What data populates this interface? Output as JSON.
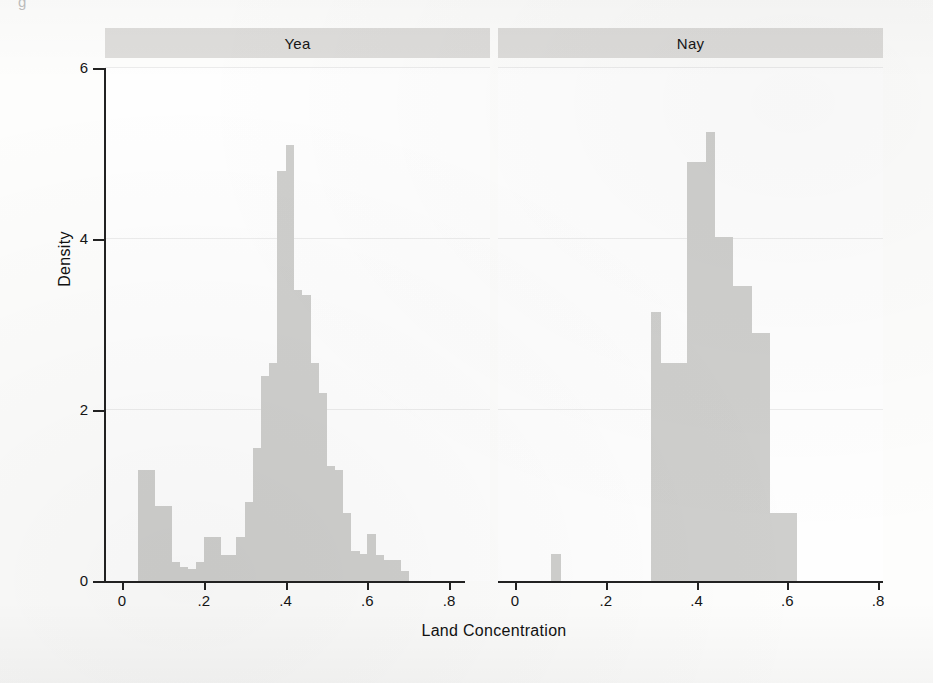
{
  "figure": {
    "stray_mark": "g",
    "ylabel": "Density",
    "xlabel": "Land Concentration",
    "bar_color": "#cfcfcd",
    "strip_color": "#dedddb",
    "axis_color": "#222222",
    "grid_color": "#ececec"
  },
  "axes": {
    "y_ticks": [
      0,
      2,
      4,
      6
    ],
    "y_tick_labels": [
      "0",
      "2",
      "4",
      "6"
    ],
    "x_ticks": [
      0,
      0.2,
      0.4,
      0.6,
      0.8
    ],
    "x_tick_labels": [
      "0",
      ".2",
      ".4",
      ".6",
      ".8"
    ]
  },
  "chart_data": {
    "type": "bar",
    "title": "",
    "subtitle": "",
    "xlabel": "Land Concentration",
    "ylabel": "Density",
    "xlim": [
      0,
      0.8
    ],
    "ylim": [
      0,
      6
    ],
    "grid": true,
    "grid_axis": "y",
    "legend": "none",
    "panel_layout": "side-by-side facets",
    "bin_width": 0.02,
    "panels": [
      {
        "label": "Yea",
        "bins": [
          {
            "x": 0.04,
            "density": 1.3
          },
          {
            "x": 0.06,
            "density": 1.3
          },
          {
            "x": 0.08,
            "density": 0.88
          },
          {
            "x": 0.1,
            "density": 0.88
          },
          {
            "x": 0.12,
            "density": 0.22
          },
          {
            "x": 0.14,
            "density": 0.16
          },
          {
            "x": 0.16,
            "density": 0.14
          },
          {
            "x": 0.18,
            "density": 0.22
          },
          {
            "x": 0.2,
            "density": 0.52
          },
          {
            "x": 0.22,
            "density": 0.52
          },
          {
            "x": 0.24,
            "density": 0.3
          },
          {
            "x": 0.26,
            "density": 0.3
          },
          {
            "x": 0.28,
            "density": 0.52
          },
          {
            "x": 0.3,
            "density": 0.92
          },
          {
            "x": 0.32,
            "density": 1.55
          },
          {
            "x": 0.34,
            "density": 2.4
          },
          {
            "x": 0.36,
            "density": 2.55
          },
          {
            "x": 0.38,
            "density": 4.8
          },
          {
            "x": 0.4,
            "density": 5.1
          },
          {
            "x": 0.42,
            "density": 3.4
          },
          {
            "x": 0.44,
            "density": 3.35
          },
          {
            "x": 0.46,
            "density": 2.55
          },
          {
            "x": 0.48,
            "density": 2.2
          },
          {
            "x": 0.5,
            "density": 1.35
          },
          {
            "x": 0.52,
            "density": 1.3
          },
          {
            "x": 0.54,
            "density": 0.8
          },
          {
            "x": 0.56,
            "density": 0.35
          },
          {
            "x": 0.58,
            "density": 0.32
          },
          {
            "x": 0.6,
            "density": 0.55
          },
          {
            "x": 0.62,
            "density": 0.3
          },
          {
            "x": 0.64,
            "density": 0.25
          },
          {
            "x": 0.66,
            "density": 0.24
          },
          {
            "x": 0.68,
            "density": 0.12
          }
        ]
      },
      {
        "label": "Nay",
        "bins": [
          {
            "x": 0.08,
            "density": 0.32
          },
          {
            "x": 0.3,
            "density": 3.15
          },
          {
            "x": 0.32,
            "density": 2.55
          },
          {
            "x": 0.34,
            "density": 2.55
          },
          {
            "x": 0.36,
            "density": 2.55
          },
          {
            "x": 0.38,
            "density": 4.9
          },
          {
            "x": 0.4,
            "density": 4.9
          },
          {
            "x": 0.42,
            "density": 5.25
          },
          {
            "x": 0.44,
            "density": 4.02
          },
          {
            "x": 0.46,
            "density": 4.02
          },
          {
            "x": 0.48,
            "density": 3.45
          },
          {
            "x": 0.5,
            "density": 3.45
          },
          {
            "x": 0.52,
            "density": 2.9
          },
          {
            "x": 0.54,
            "density": 2.9
          },
          {
            "x": 0.56,
            "density": 0.8
          },
          {
            "x": 0.58,
            "density": 0.8
          },
          {
            "x": 0.6,
            "density": 0.8
          }
        ]
      }
    ]
  }
}
